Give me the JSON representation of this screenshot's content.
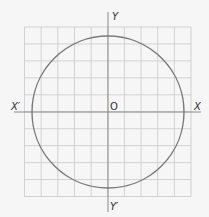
{
  "diagram": {
    "type": "coordinate-plane-circle",
    "labels": {
      "x_positive": "X",
      "x_negative": "X′",
      "y_positive": "Y",
      "y_negative": "Y′",
      "origin": "O"
    },
    "grid": {
      "columns": 10,
      "rows": 10,
      "left": 24.5,
      "top": 27,
      "right": 191,
      "bottom": 196.5
    },
    "axes": {
      "x_axis_y": 112,
      "x_axis_from": 14,
      "x_axis_to": 201,
      "y_axis_x": 108,
      "y_axis_from": 12,
      "y_axis_to": 212
    },
    "circle": {
      "cx": 108,
      "cy": 112,
      "r": 76
    },
    "colors": {
      "background": "#f6f6f6",
      "grid": "#c9c9c9",
      "axes": "#8a8a8a",
      "circle": "#7a7a7a",
      "text": "#333333"
    }
  }
}
